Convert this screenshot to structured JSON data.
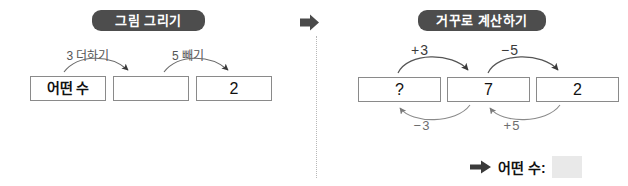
{
  "panels": {
    "left": {
      "badge": "그림 그리기",
      "boxes": [
        {
          "text": "어떤 수"
        },
        {
          "text": ""
        },
        {
          "text": "2"
        }
      ],
      "arrow_labels": [
        {
          "text": "3 더하기"
        },
        {
          "text": "5 빼기"
        }
      ]
    },
    "right": {
      "badge": "거꾸로 계산하기",
      "boxes": [
        {
          "text": "?"
        },
        {
          "text": "7"
        },
        {
          "text": "2"
        }
      ],
      "top_labels": [
        {
          "text": "+3"
        },
        {
          "text": "−5"
        }
      ],
      "bottom_labels": [
        {
          "text": "−3"
        },
        {
          "text": "+5"
        }
      ]
    }
  },
  "answer": {
    "label": "어떤 수:",
    "value": ""
  },
  "icons": {
    "transition_arrow": "right-arrow-icon",
    "answer_arrow": "right-arrow-icon"
  },
  "colors": {
    "badge_bg": "#4d4d4d",
    "badge_text": "#ffffff",
    "box_border": "#8a8a8a",
    "label_text": "#555555",
    "divider": "#b8b8b8",
    "answer_blank": "#e9e9e9"
  }
}
